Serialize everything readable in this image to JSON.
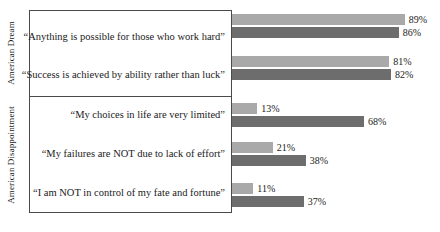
{
  "chart_data": {
    "type": "bar",
    "orientation": "horizontal",
    "title": "",
    "xlabel": "",
    "ylabel": "",
    "xlim": [
      0,
      100
    ],
    "grid": false,
    "legend": "none",
    "value_suffix": "%",
    "groups": [
      {
        "name": "American Dream",
        "categories": [
          "“Anything is possible for those who work hard”",
          "“Success is achieved by ability rather than luck”"
        ]
      },
      {
        "name": "American Disappointment",
        "categories": [
          "“My choices in life are very limited”",
          "“My failures are NOT due to lack of effort”",
          "“I am NOT in control of my fate and fortune”"
        ]
      }
    ],
    "categories": [
      "“Anything is possible for those who work hard”",
      "“Success is achieved by ability rather than luck”",
      "“My choices in life are very limited”",
      "“My failures are NOT due to lack of effort”",
      "“I am NOT in control of my fate and fortune”"
    ],
    "series": [
      {
        "name": "series-light",
        "color": "#a9a9a9",
        "values": [
          89,
          81,
          13,
          21,
          11
        ]
      },
      {
        "name": "series-dark",
        "color": "#6d6d6d",
        "values": [
          86,
          82,
          68,
          38,
          37
        ]
      }
    ],
    "value_labels": {
      "light": [
        "89%",
        "81%",
        "13%",
        "21%",
        "11%"
      ],
      "dark": [
        "86%",
        "82%",
        "68%",
        "38%",
        "37%"
      ]
    }
  },
  "axis": {
    "group_labels": [
      "American Dream",
      "American Disappointment"
    ]
  }
}
